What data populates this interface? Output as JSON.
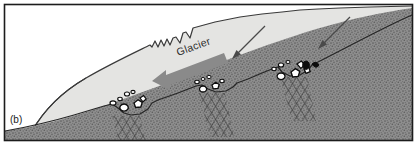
{
  "figure": {
    "panel_label": "(b)",
    "glacier_label": "Glacier",
    "caption_fragment": "",
    "border_color": "#1c1c1c",
    "background_color": "#ffffff"
  },
  "colors": {
    "ice_fill": "#e4e4e2",
    "ice_outline": "#3a3a3a",
    "bedrock_fill": "#8e8e8e",
    "bedrock_stipple": "#5d5d5d",
    "bedrock_outline": "#262626",
    "flow_arrow": "#8a8a8a",
    "thin_arrow": "#4a4a4a",
    "clast_outline": "#0d0d0d",
    "clast_fill": "#ffffff",
    "fracture_line": "#3c3c3c"
  },
  "layers": {
    "ice_name": "glacier-ice-body",
    "bedrock_name": "bedrock-substrate"
  },
  "flow_arrow": {
    "name": "glacier-flow-direction-arrow",
    "direction": "left"
  },
  "stress_arrows": [
    {
      "name": "stress-arrow-1",
      "direction": "down-left"
    },
    {
      "name": "stress-arrow-2",
      "direction": "down-left"
    }
  ],
  "crevasses": [
    {
      "name": "crevasse-1"
    },
    {
      "name": "crevasse-2"
    },
    {
      "name": "crevasse-3"
    },
    {
      "name": "crevasse-4"
    },
    {
      "name": "crevasse-5"
    }
  ],
  "plucked_hollows": [
    {
      "name": "plucked-hollow-left",
      "clast_count": 7
    },
    {
      "name": "plucked-hollow-middle",
      "clast_count": 6
    },
    {
      "name": "plucked-hollow-right",
      "clast_count": 9
    }
  ],
  "fracture_zones": [
    {
      "name": "fracture-zone-left"
    },
    {
      "name": "fracture-zone-middle"
    },
    {
      "name": "fracture-zone-right"
    }
  ]
}
